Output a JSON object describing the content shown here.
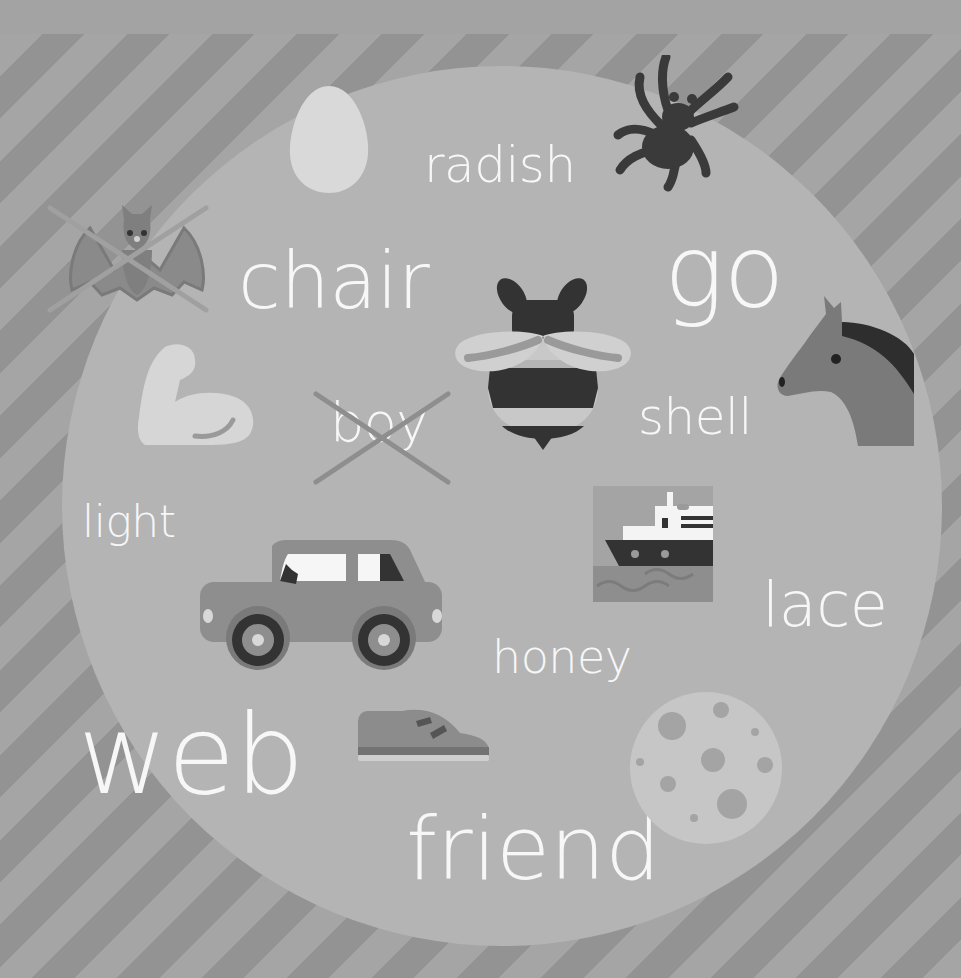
{
  "colors": {
    "background_light_stripe": "#a5a5a5",
    "background_dark_stripe": "#939393",
    "top_band": "#a3a3a3",
    "circle": "#b4b4b4",
    "word_text": "#f7f7f7",
    "cross_mark": "#8e8e8e"
  },
  "words": [
    {
      "id": "radish",
      "text": "radish",
      "crossed": false
    },
    {
      "id": "chair",
      "text": "chair",
      "crossed": false
    },
    {
      "id": "go",
      "text": "go",
      "crossed": false
    },
    {
      "id": "boy",
      "text": "boy",
      "crossed": true
    },
    {
      "id": "shell",
      "text": "shell",
      "crossed": false
    },
    {
      "id": "light",
      "text": "light",
      "crossed": false
    },
    {
      "id": "lace",
      "text": "lace",
      "crossed": false
    },
    {
      "id": "honey",
      "text": "honey",
      "crossed": false
    },
    {
      "id": "web",
      "text": "web",
      "crossed": false
    },
    {
      "id": "friend",
      "text": "friend",
      "crossed": false
    }
  ],
  "pictures": [
    {
      "id": "egg",
      "name": "egg-icon",
      "crossed": false
    },
    {
      "id": "spider",
      "name": "spider-icon",
      "crossed": false
    },
    {
      "id": "bat",
      "name": "bat-icon",
      "crossed": true
    },
    {
      "id": "bee",
      "name": "bee-icon",
      "crossed": false
    },
    {
      "id": "horse",
      "name": "horse-icon",
      "crossed": false
    },
    {
      "id": "arm",
      "name": "flexed-arm-icon",
      "crossed": false
    },
    {
      "id": "ship",
      "name": "ship-icon",
      "crossed": false
    },
    {
      "id": "car",
      "name": "car-icon",
      "crossed": false
    },
    {
      "id": "shoe",
      "name": "shoe-icon",
      "crossed": false
    },
    {
      "id": "moon",
      "name": "moon-icon",
      "crossed": false
    }
  ]
}
